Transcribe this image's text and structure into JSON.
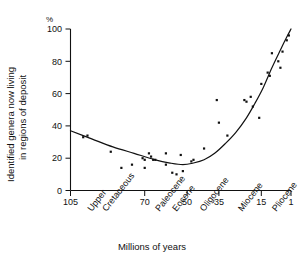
{
  "chart_data": {
    "type": "scatter",
    "title": "",
    "xlabel": "Millions of years",
    "ylabel": "Identified genera now living in regions of deposit",
    "ylabel_line1": "Identified genera now living",
    "ylabel_line2": "in regions of deposit",
    "yunit": "%",
    "xlim": [
      105,
      1
    ],
    "ylim": [
      0,
      100
    ],
    "x_reversed": true,
    "grid": false,
    "legend": "none",
    "ytick_labels": [
      "0",
      "20",
      "40",
      "60",
      "80",
      "100"
    ],
    "ytick_values": [
      0,
      20,
      40,
      60,
      80,
      100
    ],
    "xtick_labels": [
      "105",
      "70",
      "50",
      "35",
      "15",
      "1"
    ],
    "xtick_values": [
      105,
      70,
      50,
      35,
      15,
      1
    ],
    "epoch_labels": [
      {
        "text": "Upper",
        "at": 95
      },
      {
        "text": "Cretaceous",
        "at": 88
      },
      {
        "text": "Paleocene",
        "at": 63
      },
      {
        "text": "Eocene",
        "at": 55
      },
      {
        "text": "Oligocene",
        "at": 42
      },
      {
        "text": "Miocene",
        "at": 24
      },
      {
        "text": "Pliocene",
        "at": 8
      }
    ],
    "points": [
      {
        "x": 99,
        "y": 33
      },
      {
        "x": 97,
        "y": 34
      },
      {
        "x": 86,
        "y": 24
      },
      {
        "x": 81,
        "y": 14
      },
      {
        "x": 76,
        "y": 16
      },
      {
        "x": 71,
        "y": 20
      },
      {
        "x": 70,
        "y": 19
      },
      {
        "x": 70,
        "y": 14
      },
      {
        "x": 68,
        "y": 23
      },
      {
        "x": 67,
        "y": 21
      },
      {
        "x": 66,
        "y": 19
      },
      {
        "x": 65,
        "y": 19
      },
      {
        "x": 60,
        "y": 23
      },
      {
        "x": 60,
        "y": 16
      },
      {
        "x": 57,
        "y": 11
      },
      {
        "x": 55,
        "y": 10
      },
      {
        "x": 53,
        "y": 22
      },
      {
        "x": 52,
        "y": 12
      },
      {
        "x": 48,
        "y": 18
      },
      {
        "x": 47,
        "y": 19
      },
      {
        "x": 42,
        "y": 26
      },
      {
        "x": 36,
        "y": 56
      },
      {
        "x": 35,
        "y": 42
      },
      {
        "x": 31,
        "y": 34
      },
      {
        "x": 23,
        "y": 56
      },
      {
        "x": 22,
        "y": 55
      },
      {
        "x": 20,
        "y": 58
      },
      {
        "x": 19,
        "y": 52
      },
      {
        "x": 16,
        "y": 45
      },
      {
        "x": 15,
        "y": 66
      },
      {
        "x": 12,
        "y": 73
      },
      {
        "x": 11,
        "y": 71
      },
      {
        "x": 10,
        "y": 85
      },
      {
        "x": 7,
        "y": 80
      },
      {
        "x": 6,
        "y": 76
      },
      {
        "x": 5,
        "y": 86
      },
      {
        "x": 3,
        "y": 93
      },
      {
        "x": 2,
        "y": 96
      }
    ],
    "fit_curve": [
      {
        "x": 105,
        "y": 37
      },
      {
        "x": 95,
        "y": 32
      },
      {
        "x": 85,
        "y": 27
      },
      {
        "x": 75,
        "y": 23
      },
      {
        "x": 65,
        "y": 19
      },
      {
        "x": 58,
        "y": 17
      },
      {
        "x": 52,
        "y": 16
      },
      {
        "x": 47,
        "y": 17
      },
      {
        "x": 42,
        "y": 19
      },
      {
        "x": 37,
        "y": 23
      },
      {
        "x": 32,
        "y": 29
      },
      {
        "x": 27,
        "y": 36
      },
      {
        "x": 22,
        "y": 45
      },
      {
        "x": 18,
        "y": 54
      },
      {
        "x": 14,
        "y": 64
      },
      {
        "x": 10,
        "y": 76
      },
      {
        "x": 6,
        "y": 87
      },
      {
        "x": 3,
        "y": 95
      },
      {
        "x": 1,
        "y": 100
      }
    ]
  }
}
